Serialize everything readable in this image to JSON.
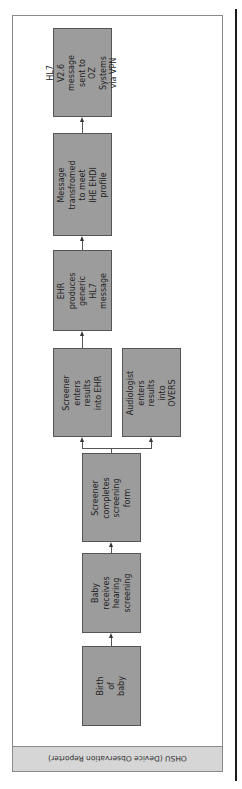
{
  "diagram": {
    "orientation": "rotated 90 degrees counter-clockwise; flow runs bottom to top",
    "swimlane_label": "OHSU (Device Observation Reporter)",
    "nodes": [
      {
        "id": "birth",
        "label": "Birth of baby"
      },
      {
        "id": "screening",
        "label": "Baby receives\nhearing\nscreening"
      },
      {
        "id": "form",
        "label": "Screener\ncompletes\nscreening form"
      },
      {
        "id": "screener_ehr",
        "label": "Screener\nenters results\ninto EHR"
      },
      {
        "id": "audiologist",
        "label": "Audiologist\nenters results\ninto OVERS"
      },
      {
        "id": "ehr_hl7",
        "label": "EHR produces\ngeneric HL7\nmessage"
      },
      {
        "id": "transform",
        "label": "Message\ntransfromed to meet\nIHE EHDI profile"
      },
      {
        "id": "send",
        "label": "HL7 V2.6 message\nsent to OZ\nSystems via VPN"
      }
    ],
    "edges": [
      {
        "from": "birth",
        "to": "screening"
      },
      {
        "from": "screening",
        "to": "form"
      },
      {
        "from": "form",
        "to": "screener_ehr"
      },
      {
        "from": "form",
        "to": "audiologist"
      },
      {
        "from": "screener_ehr",
        "to": "ehr_hl7"
      },
      {
        "from": "ehr_hl7",
        "to": "transform"
      },
      {
        "from": "transform",
        "to": "send"
      }
    ],
    "colors": {
      "box_fill": "#9c9c9c",
      "band_fill": "#d6d6d6",
      "frame": "#8a8a8a"
    }
  }
}
